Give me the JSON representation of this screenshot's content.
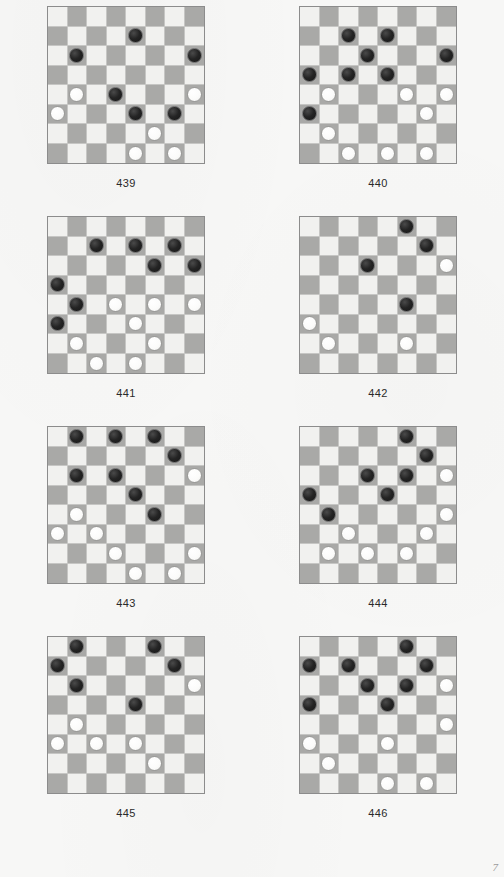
{
  "page": {
    "page_number": "7",
    "background_color": "#f7f7f6",
    "board_light_color": "#f1f1ef",
    "board_dark_color": "#a9a9a7",
    "black_piece_color": "#242424",
    "white_piece_color": "#ffffff",
    "board_border_color": "#8c8c8c",
    "columns": 8,
    "rows": 8
  },
  "legend": {
    "black_label": "Black piece",
    "white_label": "White piece",
    "empty_label": "Empty square"
  },
  "puzzles": [
    {
      "caption": "439",
      "black": [
        [
          1,
          4
        ],
        [
          2,
          1
        ],
        [
          2,
          7
        ],
        [
          4,
          3
        ],
        [
          5,
          4
        ],
        [
          5,
          6
        ]
      ],
      "white": [
        [
          4,
          1
        ],
        [
          4,
          7
        ],
        [
          5,
          0
        ],
        [
          6,
          5
        ],
        [
          7,
          4
        ],
        [
          7,
          6
        ]
      ]
    },
    {
      "caption": "440",
      "black": [
        [
          1,
          2
        ],
        [
          1,
          4
        ],
        [
          2,
          3
        ],
        [
          2,
          7
        ],
        [
          3,
          0
        ],
        [
          3,
          2
        ],
        [
          3,
          4
        ],
        [
          5,
          0
        ]
      ],
      "white": [
        [
          4,
          1
        ],
        [
          4,
          5
        ],
        [
          4,
          7
        ],
        [
          5,
          6
        ],
        [
          6,
          1
        ],
        [
          7,
          2
        ],
        [
          7,
          4
        ],
        [
          7,
          6
        ]
      ]
    },
    {
      "caption": "441",
      "black": [
        [
          1,
          2
        ],
        [
          1,
          4
        ],
        [
          1,
          6
        ],
        [
          2,
          5
        ],
        [
          2,
          7
        ],
        [
          3,
          0
        ],
        [
          4,
          1
        ],
        [
          5,
          0
        ]
      ],
      "white": [
        [
          4,
          3
        ],
        [
          4,
          5
        ],
        [
          4,
          7
        ],
        [
          5,
          4
        ],
        [
          6,
          1
        ],
        [
          6,
          5
        ],
        [
          7,
          2
        ],
        [
          7,
          4
        ]
      ]
    },
    {
      "caption": "442",
      "black": [
        [
          0,
          5
        ],
        [
          1,
          6
        ],
        [
          2,
          3
        ],
        [
          4,
          5
        ]
      ],
      "white": [
        [
          2,
          7
        ],
        [
          5,
          0
        ],
        [
          6,
          1
        ],
        [
          6,
          5
        ]
      ]
    },
    {
      "caption": "443",
      "black": [
        [
          0,
          1
        ],
        [
          0,
          3
        ],
        [
          0,
          5
        ],
        [
          1,
          6
        ],
        [
          2,
          1
        ],
        [
          2,
          3
        ],
        [
          3,
          4
        ],
        [
          4,
          5
        ]
      ],
      "white": [
        [
          2,
          7
        ],
        [
          4,
          1
        ],
        [
          5,
          0
        ],
        [
          5,
          2
        ],
        [
          6,
          3
        ],
        [
          6,
          7
        ],
        [
          7,
          4
        ],
        [
          7,
          6
        ]
      ]
    },
    {
      "caption": "444",
      "black": [
        [
          0,
          5
        ],
        [
          1,
          6
        ],
        [
          2,
          3
        ],
        [
          2,
          5
        ],
        [
          3,
          0
        ],
        [
          3,
          4
        ],
        [
          4,
          1
        ]
      ],
      "white": [
        [
          2,
          7
        ],
        [
          4,
          7
        ],
        [
          5,
          2
        ],
        [
          5,
          6
        ],
        [
          6,
          1
        ],
        [
          6,
          3
        ],
        [
          6,
          5
        ]
      ]
    },
    {
      "caption": "445",
      "black": [
        [
          0,
          1
        ],
        [
          0,
          5
        ],
        [
          1,
          0
        ],
        [
          1,
          6
        ],
        [
          2,
          1
        ],
        [
          3,
          4
        ]
      ],
      "white": [
        [
          2,
          7
        ],
        [
          4,
          1
        ],
        [
          5,
          0
        ],
        [
          5,
          2
        ],
        [
          5,
          4
        ],
        [
          6,
          5
        ]
      ]
    },
    {
      "caption": "446",
      "black": [
        [
          0,
          5
        ],
        [
          1,
          0
        ],
        [
          1,
          2
        ],
        [
          1,
          6
        ],
        [
          2,
          3
        ],
        [
          2,
          5
        ],
        [
          3,
          0
        ],
        [
          3,
          4
        ]
      ],
      "white": [
        [
          2,
          7
        ],
        [
          4,
          7
        ],
        [
          5,
          0
        ],
        [
          5,
          4
        ],
        [
          6,
          1
        ],
        [
          7,
          4
        ],
        [
          7,
          6
        ]
      ]
    }
  ]
}
